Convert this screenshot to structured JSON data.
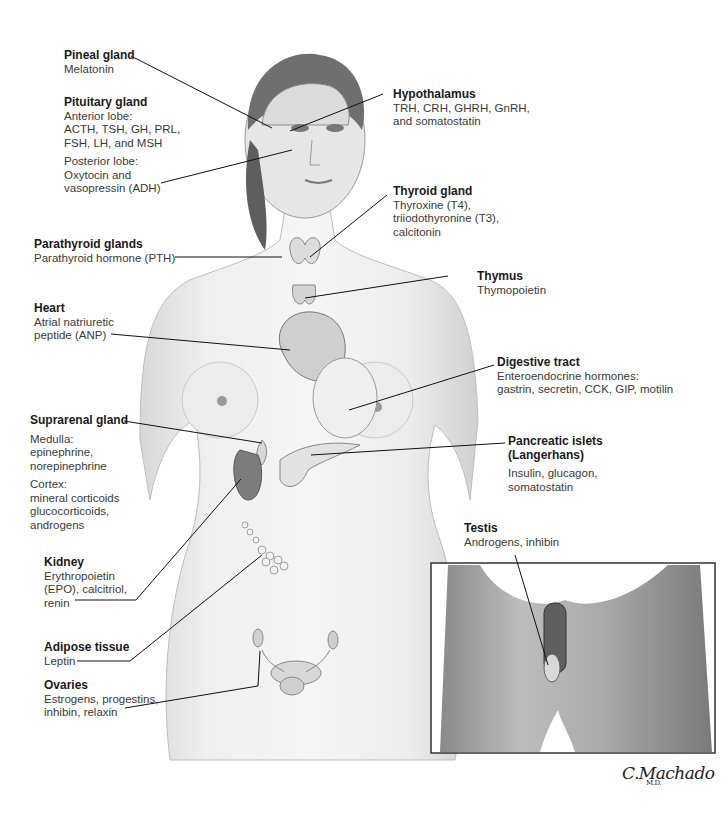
{
  "figure": {
    "type": "anatomical-illustration",
    "signature": "C.Machado",
    "signature_suffix": "M.D."
  },
  "labels": {
    "pineal": {
      "title": "Pineal gland",
      "desc": "Melatonin"
    },
    "pituitary": {
      "title": "Pituitary gland",
      "anterior": "Anterior lobe:\nACTH, TSH, GH, PRL,\nFSH, LH, and MSH",
      "posterior": "Posterior lobe:\nOxytocin and\nvasopressin (ADH)"
    },
    "hypothalamus": {
      "title": "Hypothalamus",
      "desc": "TRH, CRH, GHRH, GnRH,\nand somatostatin"
    },
    "thyroid": {
      "title": "Thyroid gland",
      "desc": "Thyroxine (T4),\ntriiodothyronine (T3),\ncalcitonin"
    },
    "parathyroid": {
      "title": "Parathyroid glands",
      "desc": "Parathyroid hormone (PTH)"
    },
    "thymus": {
      "title": "Thymus",
      "desc": "Thymopoietin"
    },
    "heart": {
      "title": "Heart",
      "desc": "Atrial natriuretic\npeptide (ANP)"
    },
    "digestive": {
      "title": "Digestive tract",
      "desc": "Enteroendocrine hormones:\ngastrin, secretin, CCK, GIP, motilin"
    },
    "suprarenal": {
      "title": "Suprarenal gland",
      "medulla": "Medulla:\nepinephrine,\nnorepinephrine",
      "cortex": "Cortex:\nmineral corticoids\nglucocorticoids,\nandrogens"
    },
    "pancreas": {
      "title": "Pancreatic islets\n(Langerhans)",
      "desc": "Insulin, glucagon,\nsomatostatin"
    },
    "testis": {
      "title": "Testis",
      "desc": "Androgens, inhibin"
    },
    "kidney": {
      "title": "Kidney",
      "desc": "Erythropoietin\n(EPO), calcitriol,\nrenin"
    },
    "adipose": {
      "title": "Adipose tissue",
      "desc": "Leptin"
    },
    "ovaries": {
      "title": "Ovaries",
      "desc": "Estrogens, progestins,\ninhibin, relaxin"
    }
  }
}
